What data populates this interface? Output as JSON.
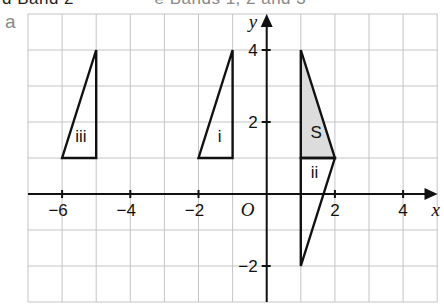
{
  "header": {
    "cropped_text_left": "d  Band 2",
    "cropped_text_right": "e  Bands 1, 2 and 3"
  },
  "part_label": "a",
  "graph": {
    "x_range": [
      -7,
      5
    ],
    "y_range": [
      -3,
      5
    ],
    "origin_px": [
      266.7,
      194
    ],
    "unit_px": [
      34.1,
      36
    ],
    "grid_px": {
      "left": 28,
      "top": 14,
      "right": 437.5,
      "bottom": 302
    },
    "axis_labels": {
      "x": "x",
      "y": "y",
      "origin": "O"
    },
    "x_ticks": [
      {
        "value": -6,
        "label": "−6"
      },
      {
        "value": -4,
        "label": "−4"
      },
      {
        "value": -2,
        "label": "−2"
      },
      {
        "value": 2,
        "label": "2"
      },
      {
        "value": 4,
        "label": "4"
      }
    ],
    "y_ticks": [
      {
        "value": 4,
        "label": "4"
      },
      {
        "value": 2,
        "label": "2"
      },
      {
        "value": -2,
        "label": "−2"
      }
    ],
    "colors": {
      "grid": "#c4c4c4",
      "shading": "#dcdcdc",
      "line": "#111111"
    },
    "shapes": [
      {
        "name": "S",
        "label": "S",
        "shaded": true,
        "vertices": [
          [
            1,
            1
          ],
          [
            2,
            1
          ],
          [
            1,
            4
          ]
        ],
        "label_pos": [
          1.45,
          1.55
        ]
      },
      {
        "name": "i",
        "label": "i",
        "shaded": false,
        "vertices": [
          [
            -2,
            1
          ],
          [
            -1,
            1
          ],
          [
            -1,
            4
          ]
        ],
        "label_pos": [
          -1.38,
          1.45
        ]
      },
      {
        "name": "ii",
        "label": "ii",
        "shaded": false,
        "vertices": [
          [
            1,
            1
          ],
          [
            2,
            1
          ],
          [
            1,
            -2
          ]
        ],
        "label_pos": [
          1.4,
          0.45
        ]
      },
      {
        "name": "iii",
        "label": "iii",
        "shaded": false,
        "vertices": [
          [
            -6,
            1
          ],
          [
            -5,
            1
          ],
          [
            -5,
            4
          ]
        ],
        "label_pos": [
          -5.45,
          1.45
        ]
      }
    ]
  }
}
